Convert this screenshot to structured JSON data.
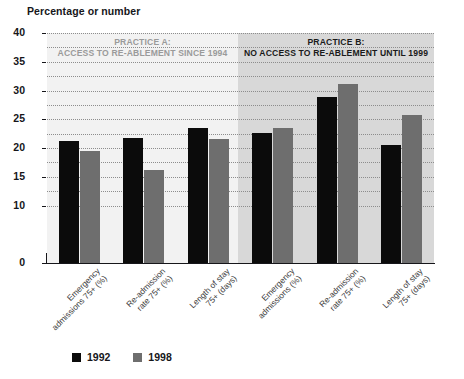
{
  "chart_data": {
    "type": "bar",
    "title": "Percentage or number",
    "xlabel": "",
    "ylabel": "Percentage or number",
    "ylim": [
      0,
      40
    ],
    "ytick_labels": [
      "0",
      "10",
      "15",
      "20",
      "25",
      "30",
      "35",
      "40"
    ],
    "ytick_values": [
      0,
      10,
      15,
      20,
      25,
      30,
      35,
      40
    ],
    "gridlines": [
      10,
      12.5,
      15,
      17.5,
      20,
      22.5,
      25,
      27.5,
      30,
      32.5,
      35,
      37.5,
      40
    ],
    "grid": true,
    "legend_position": "bottom-left",
    "categories": [
      "Emergency admissions 75+ (%)",
      "Re-admission rate 75+ (%)",
      "Length of stay 75+ (days)",
      "Emergency admissions (%)",
      "Re-admission rate 75+ (%)",
      "Length of stay 75+ (days)"
    ],
    "series": [
      {
        "name": "1992",
        "color": "#0b0b0b",
        "values": [
          21.3,
          21.8,
          23.4,
          22.6,
          28.9,
          20.5
        ]
      },
      {
        "name": "1998",
        "color": "#6e6e6e",
        "values": [
          19.5,
          16.2,
          21.6,
          23.5,
          31.1,
          25.7
        ]
      }
    ],
    "annotations": [
      {
        "id": "practice-a",
        "line1": "PRACTICE A:",
        "line2": "ACCESS TO RE-ABLEMENT SINCE 1994",
        "spans_categories": [
          0,
          1,
          2
        ],
        "band_color": "#f2f2f2",
        "text_color": "#9a9a9a"
      },
      {
        "id": "practice-b",
        "line1": "PRACTICE B:",
        "line2": "NO ACCESS TO RE-ABLEMENT UNTIL 1999",
        "spans_categories": [
          3,
          4,
          5
        ],
        "band_color": "#d8d8d8",
        "text_color": "#1a1a1a"
      }
    ]
  },
  "legend": {
    "items": [
      {
        "label": "1992",
        "color": "#0b0b0b"
      },
      {
        "label": "1998",
        "color": "#6e6e6e"
      }
    ]
  }
}
